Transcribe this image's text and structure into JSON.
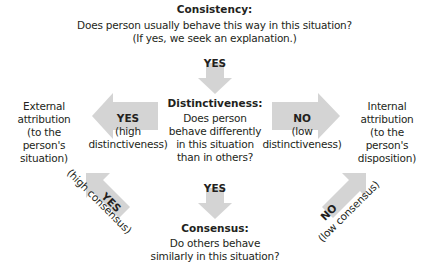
{
  "consistency": {
    "title": "Consistency:",
    "question": "Does person usually behave this way in this situation?",
    "note": "(If yes, we seek an explanation.)"
  },
  "top_arrow": {
    "label": "YES"
  },
  "distinctiveness": {
    "title": "Distinctiveness:",
    "lines": [
      "Does person",
      "behave differently",
      "in this situation",
      "than in others?"
    ]
  },
  "left_arrow": {
    "label": "YES",
    "sub_lines": [
      "(high",
      "distinctiveness)"
    ]
  },
  "right_arrow": {
    "label": "NO",
    "sub_lines": [
      "(low",
      "distinctiveness)"
    ]
  },
  "external": {
    "lines": [
      "External",
      "attribution",
      "(to the",
      "person's",
      "situation)"
    ]
  },
  "internal": {
    "lines": [
      "Internal",
      "attribution",
      "(to the",
      "person's",
      "disposition)"
    ]
  },
  "bottom_arrow": {
    "label": "YES"
  },
  "consensus": {
    "title": "Consensus:",
    "lines": [
      "Do others behave",
      "similarly in this situation?"
    ]
  },
  "diag_left_arrow": {
    "label": "YES",
    "sub": "(high consensus)"
  },
  "diag_right_arrow": {
    "label": "NO",
    "sub": "(low consensus)"
  },
  "colors": {
    "arrow": "#d4d4d4",
    "text": "#231f20",
    "background": "#ffffff"
  }
}
